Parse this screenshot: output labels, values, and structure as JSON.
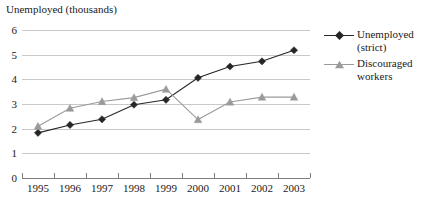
{
  "chart_data": {
    "type": "line",
    "title": "Unemployed (thousands)",
    "xlabel": "",
    "ylabel": "",
    "ylim": [
      0,
      6
    ],
    "yticks": [
      0,
      1,
      2,
      3,
      4,
      5,
      6
    ],
    "ytick_labels": [
      "0",
      "1",
      "2",
      "3",
      "4",
      "5",
      "6"
    ],
    "grid": true,
    "legend_position": "right",
    "categories": [
      "1995",
      "1996",
      "1997",
      "1998",
      "1999",
      "2000",
      "2001",
      "2002",
      "2003"
    ],
    "series": [
      {
        "name": "Unemployed (strict)",
        "color": "#262626",
        "marker": "diamond",
        "values": [
          1.83,
          2.15,
          2.38,
          2.97,
          3.17,
          4.06,
          4.52,
          4.73,
          5.18
        ]
      },
      {
        "name": "Discouraged workers",
        "color": "#9a9a9a",
        "marker": "triangle",
        "values": [
          2.1,
          2.83,
          3.1,
          3.26,
          3.6,
          2.37,
          3.08,
          3.28,
          3.28
        ]
      }
    ]
  },
  "legend": {
    "entries": [
      {
        "label_line1": "Unemployed",
        "label_line2": "(strict)"
      },
      {
        "label_line1": "Discouraged",
        "label_line2": "workers"
      }
    ]
  },
  "colors": {
    "gridline": "#c9c9c9",
    "axis": "#7d7d7d",
    "series_strict": "#262626",
    "series_discouraged": "#9a9a9a",
    "text": "#1a1a1a",
    "background": "#ffffff"
  }
}
